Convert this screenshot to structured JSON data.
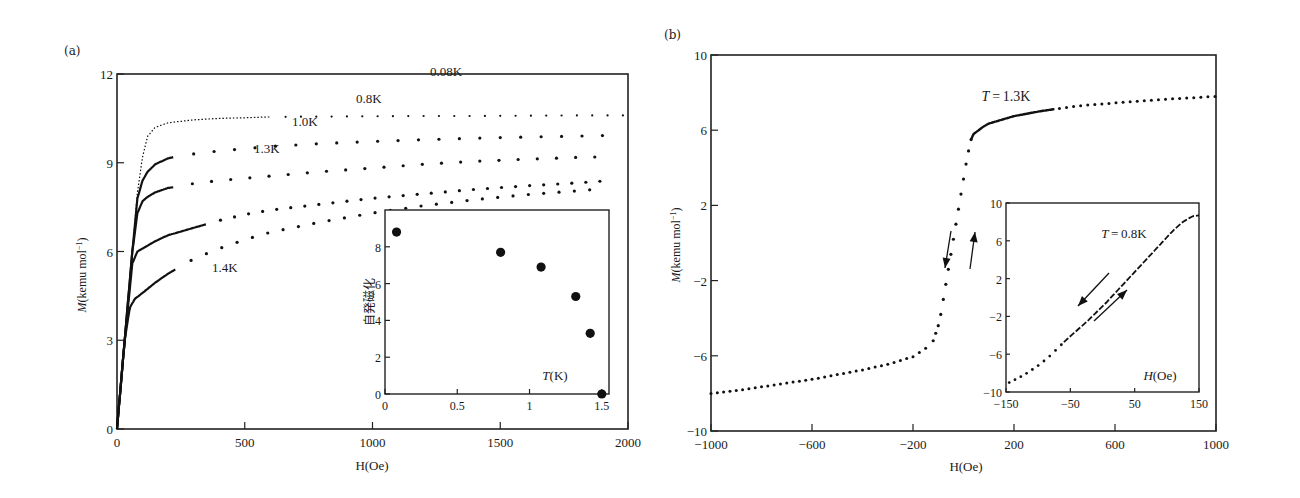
{
  "chart_data": [
    {
      "panel": "(a)",
      "type": "scatter",
      "title": "",
      "xlabel": "H(Oe)",
      "ylabel": "M(kemu mol^-1)",
      "xlim": [
        0,
        2000
      ],
      "ylim": [
        0,
        12
      ],
      "xticks": [
        0,
        500,
        1000,
        1500,
        2000
      ],
      "yticks": [
        0,
        3,
        6,
        9,
        12
      ],
      "grid": false,
      "legend": "inline labels",
      "series": [
        {
          "name": "0.08K",
          "x": [
            0,
            30,
            60,
            80,
            100,
            120,
            150,
            200,
            300,
            400,
            500,
            600,
            800,
            1000,
            1200,
            1400,
            1600,
            1800,
            2000
          ],
          "y": [
            0,
            3.0,
            6.0,
            8.0,
            9.2,
            9.9,
            10.2,
            10.35,
            10.45,
            10.5,
            10.52,
            10.55,
            10.56,
            10.57,
            10.58,
            10.58,
            10.59,
            10.6,
            10.6
          ]
        },
        {
          "name": "0.8K",
          "x": [
            0,
            30,
            60,
            80,
            100,
            120,
            150,
            200,
            250,
            300,
            400,
            600,
            800,
            1000,
            1200,
            1400,
            1600,
            1800,
            1900
          ],
          "y": [
            0,
            3.0,
            6.0,
            7.8,
            8.4,
            8.7,
            8.95,
            9.15,
            9.25,
            9.3,
            9.4,
            9.55,
            9.65,
            9.72,
            9.78,
            9.83,
            9.87,
            9.9,
            9.92
          ]
        },
        {
          "name": "1.0K",
          "x": [
            0,
            30,
            60,
            80,
            100,
            120,
            150,
            200,
            250,
            300,
            400,
            600,
            800,
            1000,
            1200,
            1400,
            1600,
            1800,
            1900
          ],
          "y": [
            0,
            3.0,
            6.0,
            7.3,
            7.7,
            7.85,
            8.0,
            8.15,
            8.2,
            8.3,
            8.4,
            8.55,
            8.7,
            8.82,
            8.95,
            9.05,
            9.12,
            9.18,
            9.2
          ]
        },
        {
          "name": "1.3K",
          "x": [
            0,
            30,
            60,
            80,
            100,
            150,
            200,
            300,
            400,
            500,
            600,
            800,
            1000,
            1200,
            1400,
            1600,
            1800,
            1900
          ],
          "y": [
            0,
            3.0,
            5.6,
            6.0,
            6.1,
            6.35,
            6.55,
            6.8,
            7.05,
            7.25,
            7.4,
            7.6,
            7.8,
            7.95,
            8.1,
            8.22,
            8.32,
            8.38
          ]
        },
        {
          "name": "1.4K",
          "x": [
            0,
            30,
            50,
            70,
            100,
            150,
            200,
            250,
            300,
            400,
            500,
            600,
            800,
            1000,
            1200,
            1400,
            1600,
            1800,
            1900
          ],
          "y": [
            0,
            3.0,
            4.1,
            4.4,
            4.6,
            4.95,
            5.25,
            5.5,
            5.75,
            6.1,
            6.4,
            6.65,
            7.0,
            7.3,
            7.55,
            7.75,
            7.92,
            8.05,
            8.12
          ]
        }
      ],
      "annotations": [
        "0.08K",
        "0.8K",
        "1.0K",
        "1.3K",
        "1.4K"
      ],
      "inset": {
        "type": "scatter",
        "xlabel": "T(K)",
        "ylabel": "自発磁化",
        "xlim": [
          0,
          1.55
        ],
        "ylim": [
          0,
          10
        ],
        "xticks": [
          0,
          0.5,
          1,
          1.5
        ],
        "yticks": [
          0,
          2,
          4,
          6,
          8
        ],
        "x": [
          0.08,
          0.8,
          1.08,
          1.32,
          1.42,
          1.5
        ],
        "y": [
          8.8,
          7.7,
          6.9,
          5.3,
          3.3,
          0
        ]
      }
    },
    {
      "panel": "(b)",
      "type": "scatter",
      "title": "",
      "xlabel": "H(Oe)",
      "ylabel": "M(kemu mol^-1)",
      "xlim": [
        -1000,
        1000
      ],
      "ylim": [
        -10,
        10
      ],
      "xticks": [
        -1000,
        -600,
        -200,
        200,
        600,
        1000
      ],
      "yticks": [
        -10,
        -6,
        -2,
        2,
        6,
        10
      ],
      "grid": false,
      "annotation": "T = 1.3K",
      "series": [
        {
          "name": "T=1.3K",
          "x": [
            -1000,
            -900,
            -800,
            -700,
            -600,
            -500,
            -400,
            -300,
            -200,
            -150,
            -120,
            -100,
            -90,
            -80,
            -70,
            -60,
            -50,
            -40,
            -30,
            -20,
            -10,
            0,
            10,
            20,
            30,
            40,
            60,
            80,
            100,
            150,
            200,
            300,
            400,
            500,
            600,
            700,
            800,
            900,
            1000
          ],
          "y": [
            -8.0,
            -7.85,
            -7.65,
            -7.45,
            -7.25,
            -7.0,
            -6.75,
            -6.45,
            -6.05,
            -5.6,
            -5.2,
            -4.4,
            -3.8,
            -3.0,
            -2.2,
            -1.4,
            -0.6,
            0.2,
            1.0,
            1.8,
            2.6,
            3.4,
            4.2,
            4.9,
            5.5,
            5.8,
            6.0,
            6.2,
            6.35,
            6.55,
            6.75,
            7.0,
            7.2,
            7.35,
            7.45,
            7.55,
            7.65,
            7.72,
            7.8
          ]
        }
      ],
      "arrows": [
        "down (decreasing field)",
        "up (increasing field)"
      ],
      "inset": {
        "type": "scatter",
        "annotation": "T = 0.8K",
        "xlabel": "H(Oe)",
        "ylabel": "",
        "xlim": [
          -150,
          150
        ],
        "ylim": [
          -10,
          10
        ],
        "xticks": [
          -150,
          -50,
          50,
          150
        ],
        "yticks": [
          -10,
          -6,
          -2,
          2,
          6,
          10
        ],
        "x": [
          -145,
          -130,
          -115,
          -100,
          -85,
          -70,
          -55,
          -40,
          -25,
          -10,
          5,
          20,
          35,
          50,
          65,
          80,
          95,
          110,
          125,
          140,
          150
        ],
        "y": [
          -9.0,
          -8.5,
          -7.9,
          -7.2,
          -6.4,
          -5.4,
          -4.4,
          -3.5,
          -2.6,
          -1.6,
          -0.6,
          0.5,
          1.6,
          2.7,
          3.8,
          4.9,
          6.0,
          7.1,
          8.0,
          8.6,
          8.7
        ]
      }
    }
  ],
  "labels": {
    "panel_a": "(a)",
    "panel_b": "(b)"
  }
}
